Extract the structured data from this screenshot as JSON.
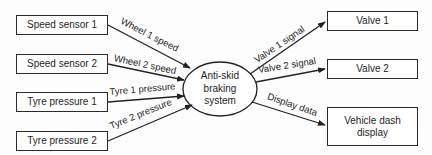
{
  "diagram": {
    "center": {
      "label_lines": [
        "Anti-skid",
        "braking",
        "system"
      ]
    },
    "inputs": [
      {
        "label": "Speed sensor 1",
        "flow": "Wheel 1 speed"
      },
      {
        "label": "Speed sensor 2",
        "flow": "Wheel 2 speed"
      },
      {
        "label": "Tyre pressure 1",
        "flow": "Tyre 1 pressure"
      },
      {
        "label": "Tyre pressure 2",
        "flow": "Tyre 2 pressure"
      }
    ],
    "outputs": [
      {
        "label": "Valve 1",
        "flow": "Valve 1 signal"
      },
      {
        "label": "Valve 2",
        "flow": "Valve 2 signal"
      },
      {
        "label_lines": [
          "Vehicle dash",
          "display"
        ],
        "flow": "Display data"
      }
    ]
  }
}
